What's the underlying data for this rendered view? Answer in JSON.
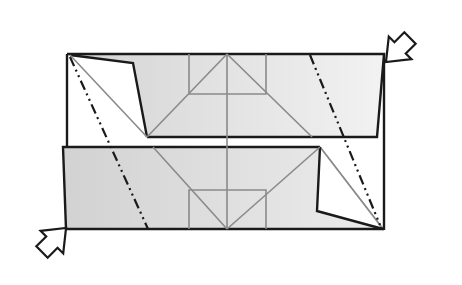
{
  "diagram": {
    "type": "origami-fold-step",
    "colors": {
      "background": "#ffffff",
      "paper_shaded": "#d9d9d9",
      "paper_white": "#ffffff",
      "edge": "#1a1a1a",
      "crease": "#8a8a8a",
      "fold_line": "#1a1a1a"
    },
    "layers": [
      {
        "name": "top-flap",
        "shade": "gray"
      },
      {
        "name": "bottom-flap",
        "shade": "gray"
      }
    ],
    "line_types": {
      "edge": "solid thick",
      "crease": "solid gray",
      "mountain_fold": "dash-dot-dot"
    },
    "arrows": [
      {
        "name": "arrow-top-right",
        "direction": "down-left"
      },
      {
        "name": "arrow-bottom-left",
        "direction": "up-right"
      }
    ]
  }
}
